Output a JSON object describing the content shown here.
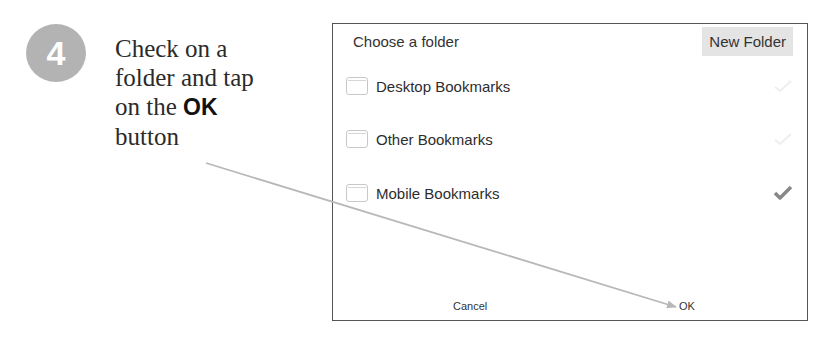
{
  "step": {
    "number": "4",
    "badge_color": "#b3b3b3"
  },
  "instruction": {
    "line1": "Check on a",
    "line2": "folder and tap",
    "line3_prefix": "on the ",
    "line3_strong": "OK",
    "line4": "button"
  },
  "dialog": {
    "title": "Choose a folder",
    "new_folder_label": "New Folder",
    "folders": [
      {
        "label": "Desktop Bookmarks",
        "icon": "folder-icon",
        "checked": false
      },
      {
        "label": "Other Bookmarks",
        "icon": "folder-icon",
        "checked": false
      },
      {
        "label": "Mobile Bookmarks",
        "icon": "folder-icon",
        "checked": true
      }
    ],
    "cancel_label": "Cancel",
    "ok_label": "OK",
    "check_color_active": "#888888",
    "check_color_inactive": "#eeeeee"
  },
  "callout": {
    "arrow_color": "#b8b8b8"
  }
}
